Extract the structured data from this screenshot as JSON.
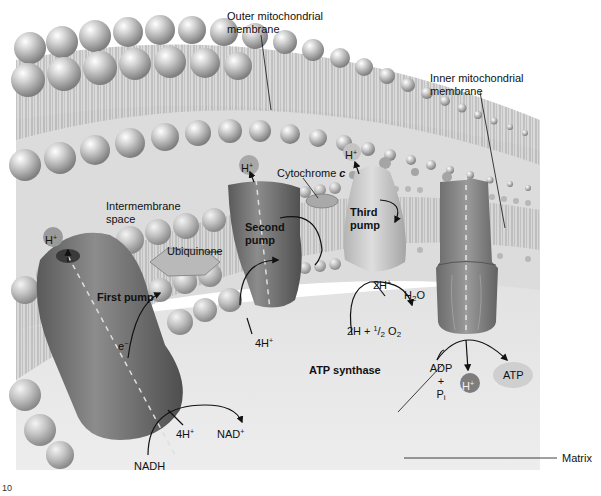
{
  "diagram": {
    "title_hidden": "Mitochondrial electron transport chain and ATP synthase",
    "labels": {
      "outer_membrane": "Outer mitochondrial membrane",
      "outer_membrane_line1": "Outer mitochondrial",
      "outer_membrane_line2": "membrane",
      "inner_membrane_line1": "Inner mitochondrial",
      "inner_membrane_line2": "membrane",
      "intermembrane_line1": "Intermembrane",
      "intermembrane_line2": "space",
      "cytochrome": "Cytochrome",
      "cytochrome_letter": "c",
      "ubiquinone": "Ubiquinone",
      "first_pump": "First pump",
      "second_pump_line1": "Second",
      "second_pump_line2": "pump",
      "third_pump_line1": "Third",
      "third_pump_line2": "pump",
      "atp_synthase": "ATP synthase",
      "matrix": "Matrix"
    },
    "chemistry": {
      "h_plus": "H",
      "plus": "+",
      "electron": "e",
      "minus": "−",
      "four_h": "4H",
      "two_h": "2H",
      "water_h": "H",
      "water_2": "2",
      "water_o": "O",
      "oxygen_eq_prefix": "2H + ",
      "half_num": "1",
      "half_den": "2",
      "o2_o": " O",
      "o2_2": "2",
      "nadh": "NADH",
      "nad": "NAD",
      "adp": "ADP",
      "adp_plus": "+",
      "pi_p": "P",
      "pi_i": "i",
      "atp": "ATP"
    },
    "figure_number": "10"
  },
  "colors": {
    "background": "#ffffff",
    "membrane_head": "#b9b9b9",
    "membrane_head_light": "#e6e6e6",
    "membrane_head_dark": "#8c8c8c",
    "intermembrane_bg": "#dcdcdc",
    "matrix_bg": "#e9e9e9",
    "pump_dark": "#6e6e6e",
    "pump_mid": "#8a8a8a",
    "pump_light": "#c6c6c6",
    "h_ion": "#8d8d8d",
    "text": "#111111"
  }
}
